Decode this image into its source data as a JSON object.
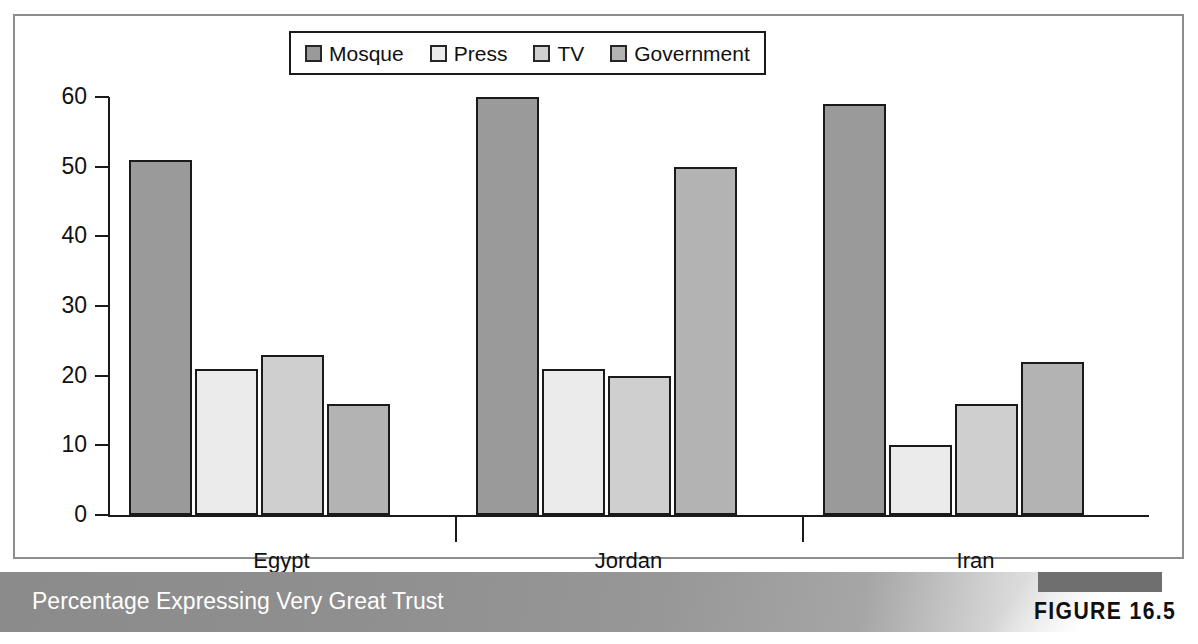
{
  "figure": {
    "caption": "Percentage Expressing Very Great Trust",
    "number_label": "FIGURE 16.5"
  },
  "chart_data": {
    "type": "bar",
    "title": "Percentage Expressing Very Great Trust",
    "xlabel": "",
    "ylabel": "",
    "ylim": [
      0,
      60
    ],
    "yticks": [
      0,
      10,
      20,
      30,
      40,
      50,
      60
    ],
    "grid": false,
    "legend_position": "top-center",
    "categories": [
      "Egypt",
      "Jordan",
      "Iran"
    ],
    "series": [
      {
        "name": "Mosque",
        "color": "#9a9a9a",
        "values": [
          51,
          60,
          59
        ]
      },
      {
        "name": "Press",
        "color": "#ebebeb",
        "values": [
          21,
          21,
          10
        ]
      },
      {
        "name": "TV",
        "color": "#cfcfcf",
        "values": [
          23,
          20,
          16
        ]
      },
      {
        "name": "Government",
        "color": "#b3b3b3",
        "values": [
          16,
          50,
          22
        ]
      }
    ]
  }
}
